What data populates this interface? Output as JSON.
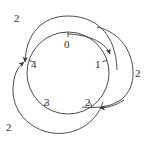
{
  "figure": {
    "background_color": "#ffffff",
    "stroke_color": "#3a3a3a",
    "text_color": "#2f2f2f"
  },
  "main_circle": {
    "name": "state-circle",
    "center_x": 68,
    "center_y": 73,
    "radius": 41
  },
  "nodes": [
    {
      "id": "node-0",
      "label": "0",
      "angle_deg": 90,
      "label_x": 64,
      "label_y": 39,
      "tick": true
    },
    {
      "id": "node-1",
      "label": "1",
      "angle_deg": 18,
      "label_x": 95,
      "label_y": 59,
      "tick": true
    },
    {
      "id": "node-2",
      "label": "2",
      "angle_deg": -54,
      "label_x": 85,
      "label_y": 97,
      "tick": true
    },
    {
      "id": "node-3",
      "label": "3",
      "angle_deg": -126,
      "label_x": 44,
      "label_y": 97,
      "tick": true
    },
    {
      "id": "node-4",
      "label": "4",
      "angle_deg": 162,
      "label_x": 31,
      "label_y": 59,
      "tick": true
    }
  ],
  "arcs": [
    {
      "id": "arc-top-left",
      "label": "2",
      "label_x": 14,
      "label_y": 13,
      "from_node": "0",
      "to_node": "4",
      "arrowhead": "down-left"
    },
    {
      "id": "arc-right",
      "label": "2",
      "label_x": 135,
      "label_y": 68,
      "from_node": "1",
      "to_node": "2",
      "arrowhead": "left"
    },
    {
      "id": "arc-bottom-left",
      "label": "2",
      "label_x": 6,
      "label_y": 122,
      "from_node": "3",
      "to_node": "4",
      "arrowhead": "up-right"
    }
  ],
  "arrowheads": [
    {
      "id": "arrowhead-down",
      "x": 110,
      "y": 56,
      "direction": "down"
    },
    {
      "id": "arrowhead-up-right",
      "x": 22,
      "y": 62,
      "direction": "up-right"
    },
    {
      "id": "arrowhead-left",
      "x": 97,
      "y": 108,
      "direction": "left"
    }
  ]
}
